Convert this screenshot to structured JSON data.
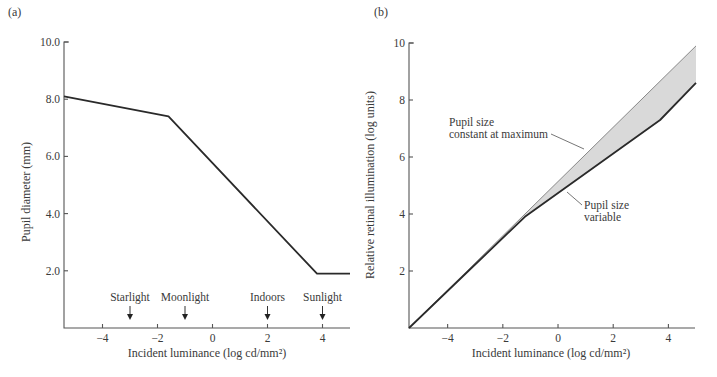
{
  "chart_data": [
    {
      "panel_label": "(a)",
      "type": "line",
      "title": "",
      "xlabel": "Incident luminance (log cd/mm²)",
      "ylabel": "Pupil diameter (mm)",
      "xlim": [
        -5.4,
        5
      ],
      "ylim": [
        0,
        10
      ],
      "xticks": [
        -4,
        -2,
        0,
        2,
        4
      ],
      "xtick_labels": [
        "−4",
        "−2",
        "0",
        "2",
        "4"
      ],
      "yticks": [
        2,
        4,
        6,
        8,
        10
      ],
      "ytick_labels": [
        "2.0",
        "4.0",
        "6.0",
        "8.0",
        "10.0"
      ],
      "grid": false,
      "series": [
        {
          "name": "Pupil diameter",
          "x": [
            -5.4,
            -1.6,
            3.8,
            5.0
          ],
          "y": [
            8.1,
            7.4,
            1.9,
            1.9
          ]
        }
      ],
      "annotations": [
        {
          "text": "Starlight",
          "x": -3
        },
        {
          "text": "Moonlight",
          "x": -1
        },
        {
          "text": "Indoors",
          "x": 2
        },
        {
          "text": "Sunlight",
          "x": 4
        }
      ]
    },
    {
      "panel_label": "(b)",
      "type": "area",
      "title": "",
      "xlabel": "Incident luminance (log cd/mm²)",
      "ylabel": "Relative retinal illumination (log units)",
      "xlim": [
        -5.4,
        5
      ],
      "ylim": [
        0,
        10
      ],
      "xticks": [
        -4,
        -2,
        0,
        2,
        4
      ],
      "xtick_labels": [
        "−4",
        "−2",
        "0",
        "2",
        "4"
      ],
      "yticks": [
        2,
        4,
        6,
        8,
        10
      ],
      "ytick_labels": [
        "2",
        "4",
        "6",
        "8",
        "10"
      ],
      "grid": false,
      "fill_between_series": true,
      "fill_color": "#d9d9d9",
      "series": [
        {
          "name": "Pupil size constant at maximum",
          "x": [
            -5.4,
            5.0
          ],
          "y": [
            0,
            9.9
          ]
        },
        {
          "name": "Pupil size variable",
          "x": [
            -5.4,
            -1.2,
            3.7,
            5.0
          ],
          "y": [
            0,
            3.9,
            7.3,
            8.6
          ]
        }
      ],
      "annotations": [
        {
          "text": "Pupil size",
          "text2": "constant at maximum",
          "points_to": "Pupil size constant at maximum"
        },
        {
          "text": "Pupil size",
          "text2": "variable",
          "points_to": "Pupil size variable"
        }
      ]
    }
  ]
}
